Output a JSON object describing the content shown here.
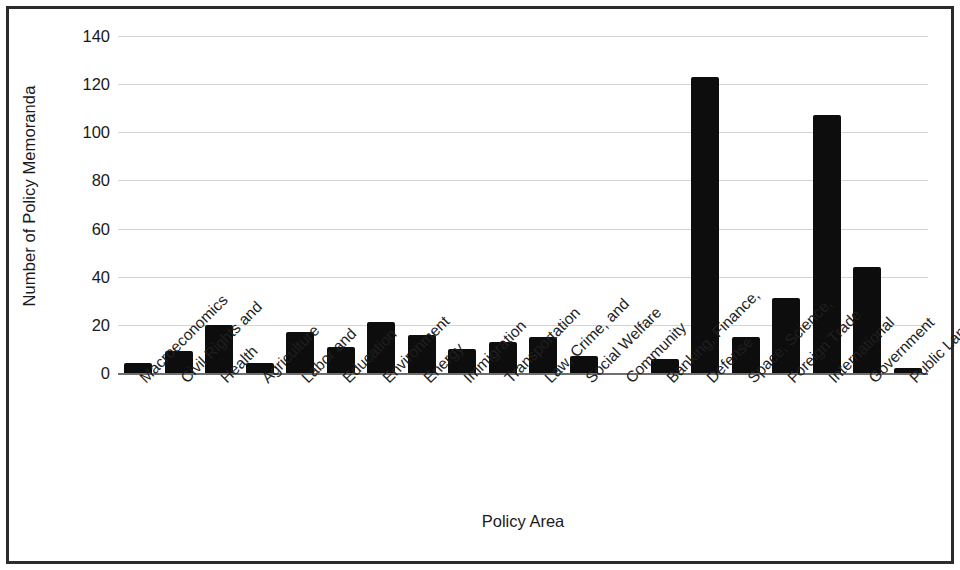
{
  "chart_data": {
    "type": "bar",
    "title": "",
    "subtitle": "",
    "xlabel": "Policy Area",
    "ylabel": "Number of Policy Memoranda",
    "orientation": "vertical",
    "grid": true,
    "gridlines_axis": "y",
    "legend": false,
    "legend_position": "none",
    "bar_color": "#0d0d0d",
    "gridline_color": "#d4d4d4",
    "axis_color": "#6e6e6e",
    "border_color": "#2b2b2b",
    "background_color": "#ffffff",
    "ylim": [
      0,
      140
    ],
    "ytick_step": 20,
    "yticks": [
      0,
      20,
      40,
      60,
      80,
      100,
      120,
      140
    ],
    "ytick_labels": [
      "0",
      "20",
      "40",
      "60",
      "80",
      "100",
      "120",
      "140"
    ],
    "categories": [
      "Macroeconomics",
      "Civil Rights and",
      "Health",
      "Agriculture",
      "Labor and",
      "Education",
      "Environment",
      "Energy",
      "Immigration",
      "Transportation",
      "Law, Crime, and",
      "Social Welfare",
      "Community",
      "Banking, Finance,",
      "Defense",
      "Space, Science,",
      "Foreign Trade",
      "International",
      "Government",
      "Public Lands"
    ],
    "values": [
      4,
      9,
      20,
      4,
      17,
      11,
      21,
      16,
      10,
      13,
      15,
      7,
      0,
      6,
      123,
      15,
      31,
      107,
      44,
      2
    ],
    "xtick_rotation_degrees": -45
  }
}
